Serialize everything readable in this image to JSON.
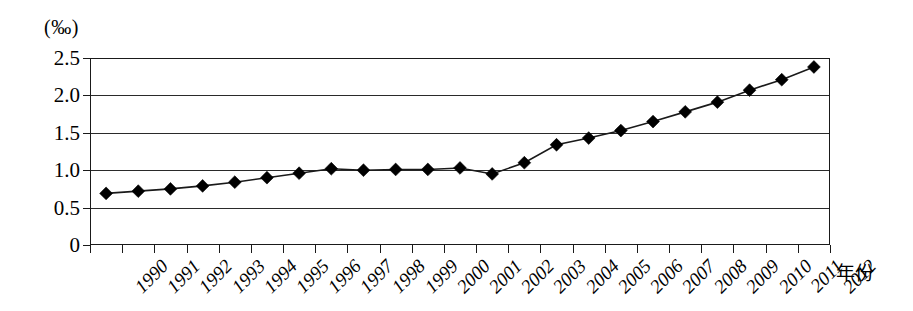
{
  "chart_data": {
    "type": "line",
    "title": "",
    "subtitle": "",
    "xlabel": "年份",
    "ylabel": "(‰)",
    "unit_label": "(‰)",
    "categories": [
      "1990",
      "1991",
      "1992",
      "1993",
      "1994",
      "1995",
      "1996",
      "1997",
      "1998",
      "1999",
      "2000",
      "2001",
      "2002",
      "2003",
      "2004",
      "2005",
      "2006",
      "2007",
      "2008",
      "2009",
      "2010",
      "2011",
      "2012"
    ],
    "values": [
      0.69,
      0.72,
      0.75,
      0.79,
      0.84,
      0.9,
      0.96,
      1.02,
      1.0,
      1.01,
      1.01,
      1.03,
      0.95,
      1.1,
      1.34,
      1.43,
      1.53,
      1.65,
      1.78,
      1.91,
      2.07,
      2.21,
      2.38
    ],
    "series": [
      {
        "name": "",
        "values": [
          0.69,
          0.72,
          0.75,
          0.79,
          0.84,
          0.9,
          0.96,
          1.02,
          1.0,
          1.01,
          1.01,
          1.03,
          0.95,
          1.1,
          1.34,
          1.43,
          1.53,
          1.65,
          1.78,
          1.91,
          2.07,
          2.21,
          2.38
        ]
      }
    ],
    "ylim": [
      0,
      2.5
    ],
    "yticks": [
      0,
      0.5,
      1.0,
      1.5,
      2.0,
      2.5
    ],
    "ytick_labels": [
      "0",
      "0.5",
      "1.0",
      "1.5",
      "2.0",
      "2.5"
    ],
    "grid": true,
    "grid_axis": "y",
    "legend": false,
    "legend_position": "none",
    "marker": "diamond",
    "line_color": "#1a1a1a",
    "marker_color": "#000000"
  }
}
